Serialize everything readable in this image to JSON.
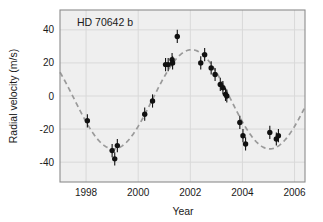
{
  "chart_data": {
    "type": "scatter",
    "title": "HD 70642 b",
    "xlabel": "Year",
    "ylabel": "Radial velocity (m/s)",
    "xlim": [
      1997.0,
      2006.4
    ],
    "ylim": [
      -52,
      52
    ],
    "xticks": [
      1998,
      2000,
      2002,
      2004,
      2006
    ],
    "xtick_labels": [
      "1998",
      "2000",
      "2002",
      "2004",
      "2006"
    ],
    "yticks": [
      40,
      20,
      0,
      -20,
      -40
    ],
    "ytick_labels": [
      "40",
      "20",
      "0",
      "-20",
      "-40"
    ],
    "grid": true,
    "legend": "none",
    "point_color": "#111111",
    "errorbar_color": "#111111",
    "fit_color": "#9a9a9a",
    "frame_color": "#8c8c8c",
    "plot_background": "#efefef",
    "series": [
      {
        "name": "Radial velocity measurements",
        "marker": "filled-circle",
        "points": [
          {
            "x": 1998.05,
            "y": -15,
            "yerr": 4
          },
          {
            "x": 1999.0,
            "y": -33,
            "yerr": 4
          },
          {
            "x": 1999.1,
            "y": -38,
            "yerr": 4
          },
          {
            "x": 1999.2,
            "y": -30,
            "yerr": 4
          },
          {
            "x": 2000.25,
            "y": -11,
            "yerr": 4
          },
          {
            "x": 2000.55,
            "y": -3,
            "yerr": 4
          },
          {
            "x": 2001.05,
            "y": 19,
            "yerr": 4
          },
          {
            "x": 2001.15,
            "y": 19,
            "yerr": 4
          },
          {
            "x": 2001.3,
            "y": 22,
            "yerr": 4
          },
          {
            "x": 2001.32,
            "y": 20,
            "yerr": 4
          },
          {
            "x": 2001.5,
            "y": 36,
            "yerr": 4
          },
          {
            "x": 2002.4,
            "y": 20,
            "yerr": 4
          },
          {
            "x": 2002.55,
            "y": 25,
            "yerr": 4
          },
          {
            "x": 2002.8,
            "y": 17,
            "yerr": 4
          },
          {
            "x": 2002.95,
            "y": 13,
            "yerr": 4
          },
          {
            "x": 2003.15,
            "y": 7,
            "yerr": 4
          },
          {
            "x": 2003.25,
            "y": 5,
            "yerr": 4
          },
          {
            "x": 2003.35,
            "y": 1,
            "yerr": 4
          },
          {
            "x": 2003.4,
            "y": 0,
            "yerr": 4
          },
          {
            "x": 2003.9,
            "y": -16,
            "yerr": 4
          },
          {
            "x": 2004.02,
            "y": -24,
            "yerr": 4
          },
          {
            "x": 2004.12,
            "y": -29,
            "yerr": 4
          },
          {
            "x": 2005.05,
            "y": -22,
            "yerr": 4
          },
          {
            "x": 2005.3,
            "y": -26,
            "yerr": 4
          },
          {
            "x": 2005.38,
            "y": -24,
            "yerr": 4
          }
        ]
      }
    ],
    "fit_curve": {
      "name": "Keplerian orbit fit",
      "style": "dashed",
      "amplitude": 30,
      "period_years": 6.0,
      "phase_offset_years": 2002.05,
      "offset": -2
    }
  }
}
